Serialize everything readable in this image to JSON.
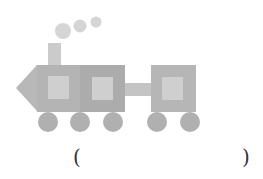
{
  "figure": {
    "colors": {
      "engine_body": "#b4b4b4",
      "middle_car": "#acacac",
      "last_car": "#b6b6b6",
      "window": "#cfcfcf",
      "nose": "#b8b8b8",
      "chimney": "#cbcbcb",
      "smoke": "#d5d5d5",
      "connector": "#c4c4c4",
      "wheel": "#b0b0b0"
    },
    "shapes": {
      "nose_triangle": {
        "points": "16,88 37,65 37,111"
      },
      "engine": {
        "x": 37,
        "y": 65,
        "w": 43,
        "h": 47
      },
      "middle_car": {
        "x": 80,
        "y": 65,
        "w": 45,
        "h": 47
      },
      "last_car": {
        "x": 151,
        "y": 65,
        "w": 45,
        "h": 47
      },
      "connector": {
        "x": 125,
        "y": 83,
        "w": 26,
        "h": 13
      },
      "chimney": {
        "x": 48,
        "y": 43,
        "w": 13,
        "h": 22
      },
      "windows": [
        {
          "x": 48,
          "y": 76,
          "w": 21,
          "h": 23
        },
        {
          "x": 92,
          "y": 77,
          "w": 21,
          "h": 23
        },
        {
          "x": 162,
          "y": 77,
          "w": 21,
          "h": 23
        }
      ],
      "wheels": [
        {
          "cx": 48,
          "cy": 122,
          "r": 10
        },
        {
          "cx": 80,
          "cy": 122,
          "r": 10
        },
        {
          "cx": 113,
          "cy": 122,
          "r": 10
        },
        {
          "cx": 157,
          "cy": 122,
          "r": 10
        },
        {
          "cx": 190,
          "cy": 122,
          "r": 10
        }
      ],
      "smoke_puffs": [
        {
          "cx": 63,
          "cy": 31,
          "r": 8
        },
        {
          "cx": 80,
          "cy": 26,
          "r": 6.5
        },
        {
          "cx": 96,
          "cy": 22,
          "r": 5.5
        }
      ]
    }
  },
  "answer": {
    "open_paren": "(",
    "close_paren": ")",
    "value": ""
  }
}
